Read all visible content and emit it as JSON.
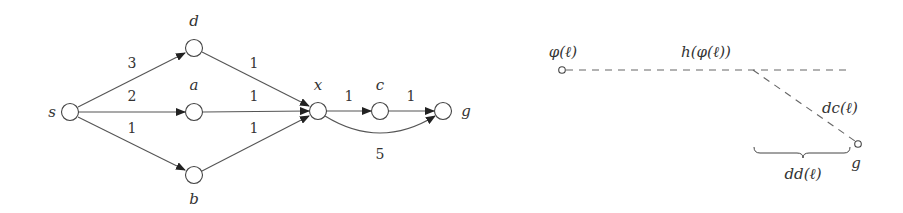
{
  "left_graph": {
    "nodes": [
      {
        "id": "s",
        "label": "s",
        "x": 70,
        "y": 112,
        "lx": 52,
        "ly": 117
      },
      {
        "id": "d",
        "label": "d",
        "x": 194,
        "y": 48,
        "lx": 194,
        "ly": 26
      },
      {
        "id": "a",
        "label": "a",
        "x": 194,
        "y": 112,
        "lx": 194,
        "ly": 90
      },
      {
        "id": "b",
        "label": "b",
        "x": 194,
        "y": 175,
        "lx": 194,
        "ly": 204
      },
      {
        "id": "x",
        "label": "x",
        "x": 318,
        "y": 111,
        "lx": 318,
        "ly": 90
      },
      {
        "id": "c",
        "label": "c",
        "x": 380,
        "y": 111,
        "lx": 380,
        "ly": 90
      },
      {
        "id": "g",
        "label": "g",
        "x": 443,
        "y": 111,
        "lx": 466,
        "ly": 116
      }
    ],
    "edges": [
      {
        "from": "s",
        "to": "d",
        "weight": "3",
        "wx": 132,
        "wy": 68
      },
      {
        "from": "s",
        "to": "a",
        "weight": "2",
        "wx": 132,
        "wy": 101
      },
      {
        "from": "s",
        "to": "b",
        "weight": "1",
        "wx": 132,
        "wy": 133
      },
      {
        "from": "d",
        "to": "x",
        "weight": "1",
        "wx": 254,
        "wy": 68
      },
      {
        "from": "a",
        "to": "x",
        "weight": "1",
        "wx": 254,
        "wy": 101
      },
      {
        "from": "b",
        "to": "x",
        "weight": "1",
        "wx": 254,
        "wy": 133
      },
      {
        "from": "x",
        "to": "c",
        "weight": "1",
        "wx": 349,
        "wy": 101
      },
      {
        "from": "c",
        "to": "g",
        "weight": "1",
        "wx": 411,
        "wy": 101
      },
      {
        "from": "x",
        "to": "g",
        "weight": "5",
        "wx": 380,
        "wy": 159,
        "curved": true
      }
    ]
  },
  "right_figure": {
    "labels": {
      "phi": "φ(ℓ)",
      "h_phi": "h(φ(ℓ))",
      "dc": "dc(ℓ)",
      "dd": "dd(ℓ)",
      "g": "g"
    },
    "points": {
      "phi": {
        "x": 562,
        "y": 70
      },
      "branch": {
        "x": 753,
        "y": 70
      },
      "line_end": {
        "x": 850,
        "y": 70
      },
      "g": {
        "x": 858,
        "y": 144
      }
    }
  }
}
